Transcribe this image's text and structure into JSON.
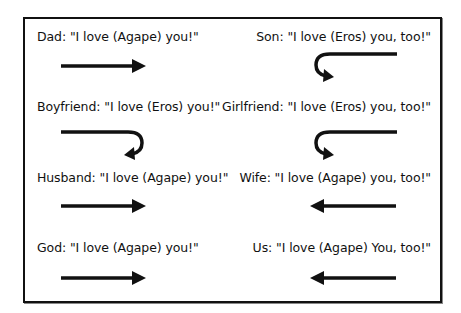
{
  "diagram": {
    "title": "",
    "rows": [
      {
        "left": {
          "speaker": "Dad",
          "text": "Dad: \"I love (Agape) you!\"",
          "arrow": "straight-right"
        },
        "right": {
          "speaker": "Son",
          "text": "Son: \"I love (Eros) you, too!\"",
          "arrow": "hook-back-left"
        }
      },
      {
        "left": {
          "speaker": "Boyfriend",
          "text": "Boyfriend: \"I love (Eros) you!\"",
          "arrow": "hook-back-right"
        },
        "right": {
          "speaker": "Girlfriend",
          "text": "Girlfriend: \"I love (Eros) you, too!\"",
          "arrow": "hook-back-left"
        }
      },
      {
        "left": {
          "speaker": "Husband",
          "text": "Husband: \"I love (Agape) you!\"",
          "arrow": "straight-right"
        },
        "right": {
          "speaker": "Wife",
          "text": "Wife: \"I love (Agape) you, too!\"",
          "arrow": "straight-left"
        }
      },
      {
        "left": {
          "speaker": "God",
          "text": "God: \"I love (Agape) you!\"",
          "arrow": "straight-right"
        },
        "right": {
          "speaker": "Us",
          "text": "Us: \"I love (Agape) You, too!\"",
          "arrow": "straight-left"
        }
      }
    ],
    "colors": {
      "ink": "#111111",
      "background": "#ffffff"
    }
  }
}
